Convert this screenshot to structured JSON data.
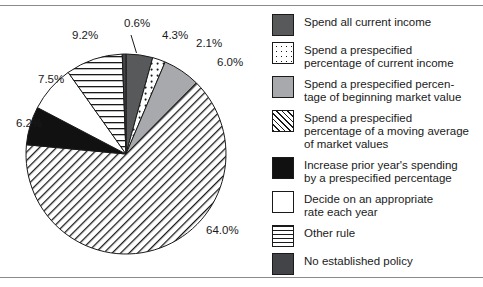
{
  "chart_data": {
    "type": "pie",
    "title": "",
    "subtitle": "",
    "xlabel": "",
    "ylabel": "",
    "grid": false,
    "legend_position": "right",
    "start_angle_deg": 0,
    "direction": "clockwise",
    "categories": [
      "Spend all current income",
      "Spend a prespecified percentage of current income",
      "Spend a prespecified percentage of beginning market value",
      "Spend a prespecified percentage of a moving average of market values",
      "Increase prior year's spending by a prespecified percentage",
      "Decide on an appropriate rate each year",
      "Other rule",
      "No established policy"
    ],
    "values": [
      4.3,
      2.1,
      6.0,
      64.0,
      6.2,
      7.5,
      9.2,
      0.6
    ],
    "data_labels": [
      "4.3%",
      "2.1%",
      "6.0%",
      "64.0%",
      "6.2%",
      "7.5%",
      "9.2%",
      "0.6%"
    ],
    "units": "percent",
    "total": 99.9,
    "colors": [
      "#58595b",
      "#ffffff",
      "#a7a9ac",
      "#ffffff",
      "#111111",
      "#ffffff",
      "#ffffff",
      "#434447"
    ],
    "patterns": [
      "solid-dark-gray",
      "dotted",
      "solid-mid-gray",
      "diagonal-hatch",
      "solid-black",
      "solid-white",
      "horizontal-lines",
      "solid-dark-gray"
    ]
  },
  "slice_labels": [
    {
      "text": "0.6%",
      "left": 124,
      "top": 10
    },
    {
      "text": "4.3%",
      "left": 162,
      "top": 22
    },
    {
      "text": "2.1%",
      "left": 196,
      "top": 30
    },
    {
      "text": "6.0%",
      "left": 217,
      "top": 49
    },
    {
      "text": "64.0%",
      "left": 206,
      "top": 217
    },
    {
      "text": "6.2%",
      "left": 16,
      "top": 110
    },
    {
      "text": "7.5%",
      "left": 38,
      "top": 66
    },
    {
      "text": "9.2%",
      "left": 72,
      "top": 22
    }
  ],
  "legend": {
    "items": [
      {
        "swatch": "sw-solid-darkgray",
        "swatch_name": "legend-swatch-spend-all-current-income",
        "lines": [
          "Spend all current income"
        ]
      },
      {
        "swatch": "sw-dots",
        "swatch_name": "legend-swatch-prespecified-pct-current-income",
        "lines": [
          "Spend a prespecified",
          "percentage of current income"
        ]
      },
      {
        "swatch": "sw-midgray",
        "swatch_name": "legend-swatch-prespecified-pct-beginning-market-value",
        "lines": [
          "Spend a prespecified percen-",
          "tage of beginning market value"
        ]
      },
      {
        "swatch": "sw-diag",
        "swatch_name": "legend-swatch-prespecified-pct-moving-average",
        "lines": [
          "Spend a prespecified",
          "percentage of a moving average",
          "of market values"
        ]
      },
      {
        "swatch": "sw-black",
        "swatch_name": "legend-swatch-increase-prior-years-spending",
        "lines": [
          "Increase prior year's spending",
          "by a prespecified percentage"
        ]
      },
      {
        "swatch": "sw-white",
        "swatch_name": "legend-swatch-decide-appropriate-rate",
        "lines": [
          "Decide on an appropriate",
          "rate each year"
        ]
      },
      {
        "swatch": "sw-horiz",
        "swatch_name": "legend-swatch-other-rule",
        "lines": [
          "Other rule"
        ]
      },
      {
        "swatch": "sw-darkgray2",
        "swatch_name": "legend-swatch-no-established-policy",
        "lines": [
          "No established policy"
        ]
      }
    ]
  }
}
